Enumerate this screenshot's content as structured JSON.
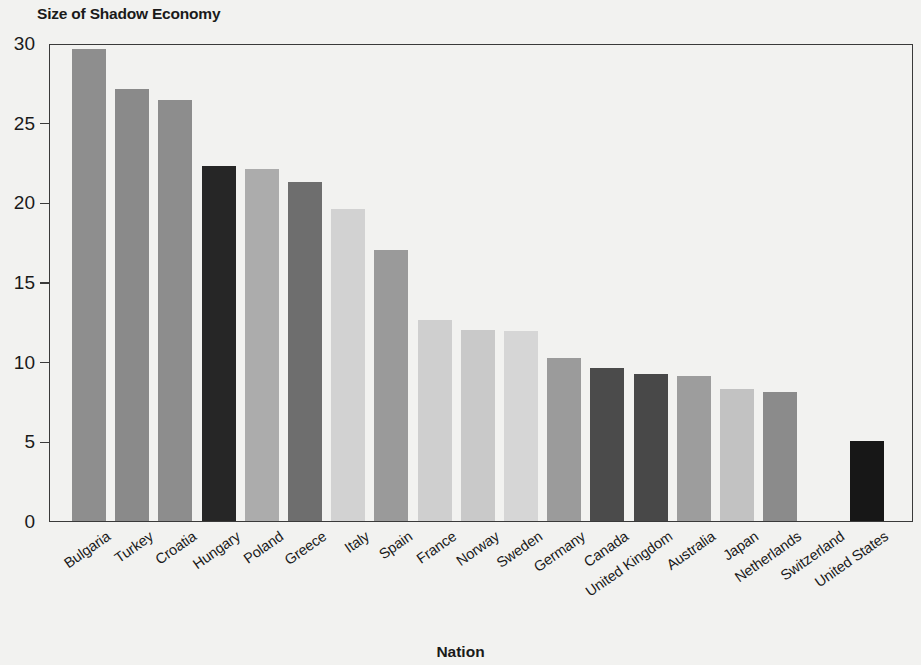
{
  "chart_data": {
    "type": "bar",
    "title": "Size of Shadow Economy",
    "xlabel": "Nation",
    "ylabel": "",
    "ylim": [
      0,
      30
    ],
    "yticks": [
      0,
      5,
      10,
      15,
      20,
      25,
      30
    ],
    "grid": false,
    "legend": null,
    "categories": [
      "Bulgaria",
      "Turkey",
      "Croatia",
      "Hungary",
      "Poland",
      "Greece",
      "Italy",
      "Spain",
      "France",
      "Norway",
      "Sweden",
      "Germany",
      "Canada",
      "United Kingdom",
      "Australia",
      "Japan",
      "Netherlands",
      "Switzerland",
      "United States"
    ],
    "values": [
      29.6,
      27.1,
      26.4,
      22.3,
      22.1,
      21.3,
      19.6,
      17.0,
      12.6,
      12.0,
      11.9,
      10.2,
      9.6,
      9.2,
      9.1,
      8.3,
      8.1,
      0,
      5.0
    ],
    "bar_colors": [
      "#8e8e8e",
      "#8a8a8a",
      "#8d8d8d",
      "#262626",
      "#acacac",
      "#6e6e6e",
      "#d2d2d2",
      "#9a9a9a",
      "#cfcfcf",
      "#c9c9c9",
      "#d6d6d6",
      "#9b9b9b",
      "#4b4b4b",
      "#484848",
      "#9d9d9d",
      "#c2c2c2",
      "#8b8b8b",
      "#f2f2f0",
      "#171717"
    ]
  },
  "axis": {
    "frame_color": "#3a3a3a",
    "background": "#f2f2f0",
    "text_color": "#1a1a1a"
  }
}
